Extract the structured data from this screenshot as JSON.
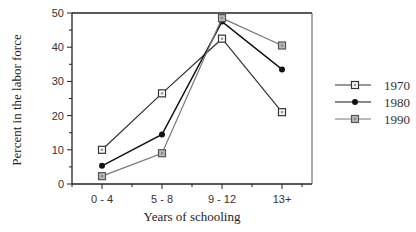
{
  "chart_data": {
    "type": "line",
    "title": "",
    "xlabel": "Years of schooling",
    "ylabel": "Percent in the labor force",
    "categories": [
      "0 - 4",
      "5 - 8",
      "9 - 12",
      "13+"
    ],
    "ylim": [
      0,
      50
    ],
    "yticks": [
      0,
      10,
      20,
      30,
      40,
      50
    ],
    "grid": false,
    "legend_position": "right",
    "series": [
      {
        "name": "1970",
        "values": [
          10,
          26.5,
          42.5,
          21
        ],
        "marker": "open-square",
        "color": "#333333"
      },
      {
        "name": "1980",
        "values": [
          5.3,
          14.5,
          47.5,
          33.5
        ],
        "marker": "filled-circle",
        "color": "#111111"
      },
      {
        "name": "1990",
        "values": [
          2.3,
          9,
          48.5,
          40.5
        ],
        "marker": "gray-square",
        "color": "#777777"
      }
    ]
  }
}
